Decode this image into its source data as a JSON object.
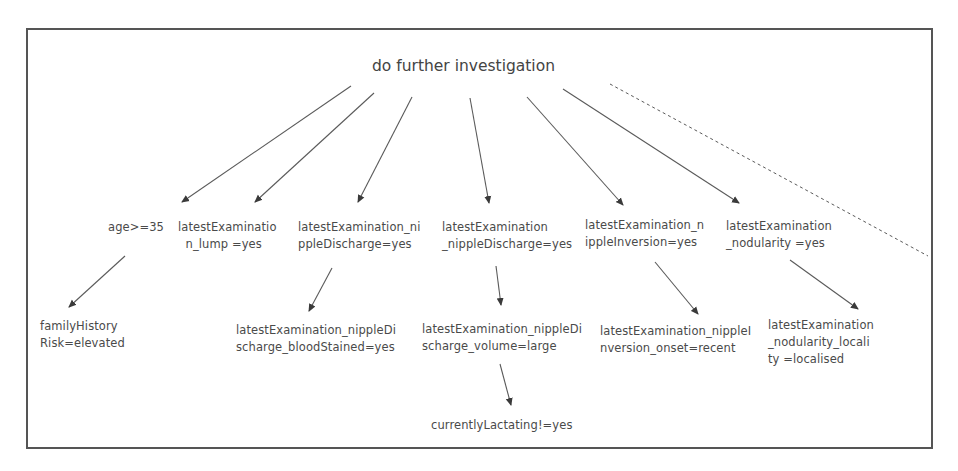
{
  "diagram": {
    "root": {
      "label": "do further investigation"
    },
    "level1": [
      {
        "id": "age",
        "label": "age>=35"
      },
      {
        "id": "lump",
        "label": "latestExaminatio\n  n_lump =yes"
      },
      {
        "id": "nd1",
        "label": "latestExamination_ni\nppleDischarge=yes"
      },
      {
        "id": "nd2",
        "label": "latestExamination\n_nippleDischarge=yes"
      },
      {
        "id": "inv",
        "label": "latestExamination_n\nippleInversion=yes"
      },
      {
        "id": "nod",
        "label": "latestExamination\n_nodularity =yes"
      }
    ],
    "level2": [
      {
        "id": "fam",
        "parent": "age",
        "label": "familyHistory\nRisk=elevated"
      },
      {
        "id": "blood",
        "parent": "nd1",
        "label": "latestExamination_nippleDi\nscharge_bloodStained=yes"
      },
      {
        "id": "vol",
        "parent": "nd2",
        "label": "latestExamination_nippleDi\nscharge_volume=large"
      },
      {
        "id": "onset",
        "parent": "inv",
        "label": "latestExamination_nippleI\nnversion_onset=recent"
      },
      {
        "id": "loc",
        "parent": "nod",
        "label": "latestExamination\n_nodularity_locali\nty =localised"
      }
    ],
    "level3": [
      {
        "id": "lact",
        "parent": "vol",
        "label": "currentlyLactating!=yes"
      }
    ],
    "edges": [
      {
        "from": "root",
        "to": "age",
        "style": "solid"
      },
      {
        "from": "root",
        "to": "lump",
        "style": "solid"
      },
      {
        "from": "root",
        "to": "nd1",
        "style": "solid"
      },
      {
        "from": "root",
        "to": "nd2",
        "style": "solid"
      },
      {
        "from": "root",
        "to": "inv",
        "style": "solid"
      },
      {
        "from": "root",
        "to": "nod",
        "style": "solid"
      },
      {
        "from": "root",
        "to": "(more)",
        "style": "dashed"
      },
      {
        "from": "age",
        "to": "fam",
        "style": "solid"
      },
      {
        "from": "nd1",
        "to": "blood",
        "style": "solid"
      },
      {
        "from": "nd2",
        "to": "vol",
        "style": "solid"
      },
      {
        "from": "inv",
        "to": "onset",
        "style": "solid"
      },
      {
        "from": "nod",
        "to": "loc",
        "style": "solid"
      },
      {
        "from": "vol",
        "to": "lact",
        "style": "solid"
      }
    ],
    "colors": {
      "line": "#555555",
      "text": "#4a4a4a",
      "border": "#555555"
    }
  }
}
